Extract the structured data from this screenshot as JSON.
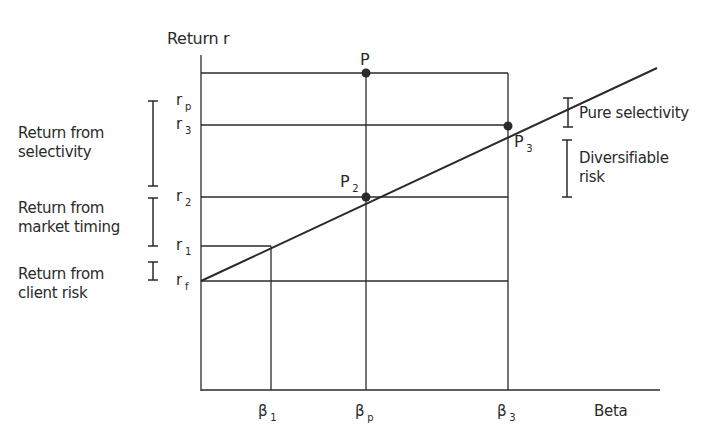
{
  "header_fragment": "...andiruosly:",
  "axes": {
    "y_title": "Return r",
    "x_title": "Beta"
  },
  "y_ticks": [
    {
      "id": "rp",
      "base": "r",
      "sub": "p"
    },
    {
      "id": "r3",
      "base": "r",
      "sub": "3"
    },
    {
      "id": "r2",
      "base": "r",
      "sub": "2"
    },
    {
      "id": "r1",
      "base": "r",
      "sub": "1"
    },
    {
      "id": "rf",
      "base": "r",
      "sub": "f"
    }
  ],
  "x_ticks": [
    {
      "id": "b1",
      "base": "β",
      "sub": "1"
    },
    {
      "id": "bp",
      "base": "β",
      "sub": "p"
    },
    {
      "id": "b3",
      "base": "β",
      "sub": "3"
    }
  ],
  "points": [
    {
      "id": "P",
      "label": "P",
      "sub": ""
    },
    {
      "id": "P2",
      "label": "P",
      "sub": "2"
    },
    {
      "id": "P3",
      "label": "P",
      "sub": "3"
    }
  ],
  "left_annotations": [
    {
      "id": "selectivity",
      "text": "Return from selectivity"
    },
    {
      "id": "market_timing",
      "text": "Return from market timing"
    },
    {
      "id": "client_risk",
      "text": "Return from client risk"
    }
  ],
  "right_annotations": [
    {
      "id": "pure_selectivity",
      "text": "Pure selectivity"
    },
    {
      "id": "diversifiable_risk",
      "text": "Diversifiable risk"
    }
  ],
  "colors": {
    "line": "#2a2a2a",
    "background": "#ffffff"
  }
}
